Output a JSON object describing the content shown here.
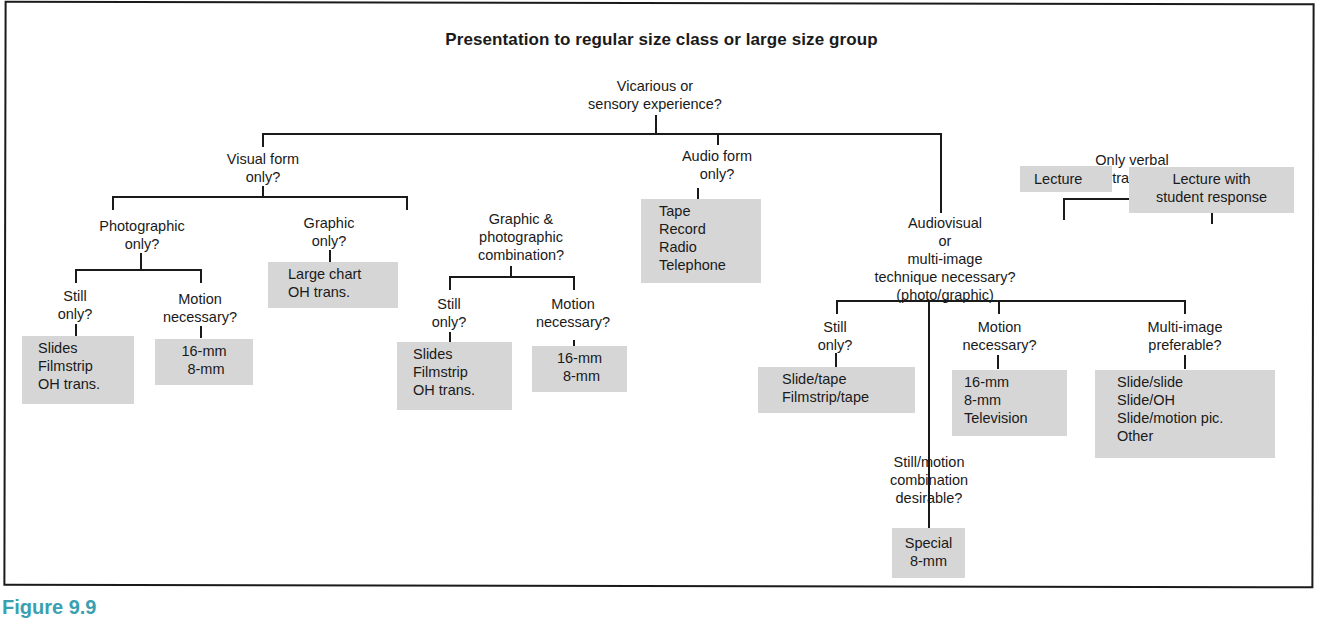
{
  "title": "Presentation to regular size class or large size group",
  "caption": "Figure 9.9",
  "colors": {
    "box_fill": "#d6d6d6",
    "line": "#1a1a1a",
    "caption": "#3aa0b0"
  },
  "nodes": {
    "vicarious": "Vicarious or\nsensory experience?",
    "visual": "Visual form\nonly?",
    "audio": "Audio form\nonly?",
    "audiovisual": "Audiovisual\nor\nmulti-image\ntechnique necessary?\n(photo/graphic)",
    "photographic": "Photographic\nonly?",
    "graphic": "Graphic\nonly?",
    "graphic_photo": "Graphic &\nphotographic\ncombination?",
    "photo_still": "Still\nonly?",
    "photo_motion": "Motion\nnecessary?",
    "gp_still": "Still\nonly?",
    "gp_motion": "Motion\nnecessary?",
    "av_still": "Still\nonly?",
    "av_motion": "Motion\nnecessary?",
    "av_multi": "Multi-image\npreferable?",
    "av_still_motion": "Still/motion\ncombination\ndesirable?",
    "verbal": "Only verbal\nabstractions?"
  },
  "outcomes": {
    "photo_still": "Slides\nFilmstrip\nOH trans.",
    "photo_motion": "16-mm\n 8-mm",
    "graphic": "Large chart\nOH trans.",
    "gp_still": "Slides\nFilmstrip\nOH trans.",
    "gp_motion": "16-mm\n 8-mm",
    "audio": "Tape\nRecord\nRadio\nTelephone",
    "av_still": "Slide/tape\nFilmstrip/tape",
    "av_motion": "16-mm\n8-mm\nTelevision",
    "av_multi": "Slide/slide\nSlide/OH\nSlide/motion pic.\nOther",
    "av_still_motion": "Special\n8-mm",
    "lecture": "Lecture",
    "lecture_response": "Lecture with\nstudent response"
  }
}
